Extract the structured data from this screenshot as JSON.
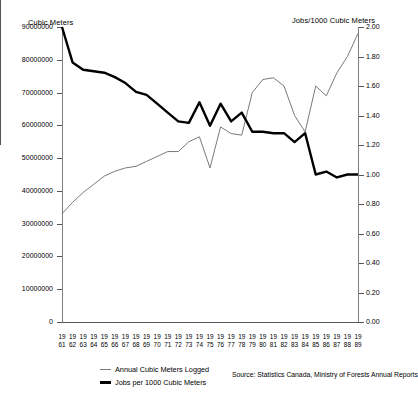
{
  "left_axis": {
    "title": "Cubic Meters",
    "ticks": [
      "90000000",
      "80000000",
      "70000000",
      "60000000",
      "50000000",
      "40000000",
      "30000000",
      "20000000",
      "10000000",
      "0"
    ]
  },
  "right_axis": {
    "title": "Jobs/1000 Cubic Meters",
    "ticks": [
      "2.00",
      "1.80",
      "1.60",
      "1.40",
      "1.20",
      "1.00",
      "0.80",
      "0.60",
      "0.40",
      "0.20",
      "0.00"
    ]
  },
  "legend": {
    "items": [
      {
        "label": "Annual Cubic Meters Logged",
        "style": "thin",
        "color": "#7a7a7a"
      },
      {
        "label": "Jobs per 1000 Cubic Meters",
        "style": "thick",
        "color": "#000000"
      }
    ]
  },
  "source": "Source: Statistics Canada, Ministry of Forests Annual Reports",
  "chart_data": {
    "type": "line",
    "title": "",
    "xlabel": "",
    "ylabel": "Cubic Meters",
    "y2label": "Jobs/1000 Cubic Meters",
    "grid": false,
    "legend_position": "bottom-left",
    "ylim": [
      0,
      90000000
    ],
    "y2lim": [
      0.0,
      2.0
    ],
    "x": [
      1961,
      1962,
      1963,
      1964,
      1965,
      1966,
      1967,
      1968,
      1969,
      1970,
      1971,
      1972,
      1973,
      1974,
      1975,
      1976,
      1977,
      1978,
      1979,
      1980,
      1981,
      1982,
      1983,
      1984,
      1985,
      1986,
      1987,
      1988,
      1989
    ],
    "xtick_labels": [
      "19\n61",
      "19\n62",
      "19\n63",
      "19\n64",
      "19\n65",
      "19\n66",
      "19\n67",
      "19\n68",
      "19\n69",
      "19\n70",
      "19\n71",
      "19\n72",
      "19\n73",
      "19\n74",
      "19\n75",
      "19\n76",
      "19\n77",
      "19\n78",
      "19\n79",
      "19\n80",
      "19\n81",
      "19\n82",
      "19\n83",
      "19\n84",
      "19\n85",
      "19\n86",
      "19\n87",
      "19\n88",
      "19\n89"
    ],
    "series": [
      {
        "name": "Annual Cubic Meters Logged",
        "axis": "left",
        "style": "thin",
        "color": "#7a7a7a",
        "values": [
          33000000,
          36500000,
          39500000,
          42000000,
          44500000,
          46000000,
          47000000,
          47500000,
          49000000,
          50500000,
          52000000,
          52000000,
          55000000,
          56500000,
          47000000,
          59500000,
          57500000,
          57000000,
          70000000,
          74000000,
          74500000,
          72000000,
          63000000,
          58000000,
          72000000,
          69000000,
          76000000,
          81000000,
          88000000
        ]
      },
      {
        "name": "Jobs per 1000 Cubic Meters",
        "axis": "right",
        "style": "thick",
        "color": "#000000",
        "values": [
          2.0,
          1.76,
          1.71,
          1.7,
          1.69,
          1.66,
          1.62,
          1.56,
          1.54,
          1.48,
          1.42,
          1.36,
          1.35,
          1.49,
          1.33,
          1.48,
          1.36,
          1.42,
          1.29,
          1.29,
          1.28,
          1.28,
          1.22,
          1.28,
          1.0,
          1.02,
          0.98,
          1.0,
          1.0
        ]
      }
    ]
  }
}
